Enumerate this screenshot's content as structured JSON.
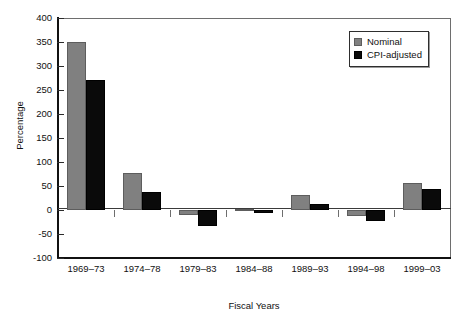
{
  "chart_data": {
    "type": "bar",
    "title": "",
    "xlabel": "Fiscal Years",
    "ylabel": "Percentage",
    "ylim": [
      -100,
      400
    ],
    "yticks": [
      400,
      350,
      300,
      250,
      200,
      150,
      100,
      50,
      0,
      -50,
      -100
    ],
    "ytick_labels": [
      "400",
      "350",
      "300",
      "250",
      "200",
      "150",
      "100",
      "50",
      "0",
      "-50",
      "-100"
    ],
    "grid": false,
    "legend_position": "top-right",
    "categories": [
      "1969–73",
      "1974–78",
      "1979–83",
      "1984–88",
      "1989–93",
      "1994–98",
      "1999–03"
    ],
    "series": [
      {
        "name": "Nominal",
        "color": "#808080",
        "values": [
          351,
          78,
          -10,
          2,
          31,
          -12,
          57
        ]
      },
      {
        "name": "CPI-adjusted",
        "color": "#000000",
        "values": [
          271,
          37,
          -33,
          -6,
          12,
          -22,
          44
        ]
      }
    ]
  },
  "legend": {
    "entries": [
      {
        "label": "Nominal",
        "swatch": "nominal-swatch"
      },
      {
        "label": "CPI-adjusted",
        "swatch": "cpi-adjusted-swatch"
      }
    ]
  }
}
